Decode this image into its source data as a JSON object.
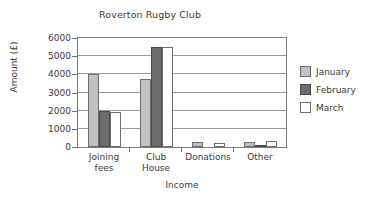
{
  "chart_data": {
    "type": "bar",
    "title": "Roverton Rugby Club",
    "xlabel": "Income",
    "ylabel": "Amount (£)",
    "categories": [
      "Joining fees",
      "Club House",
      "Donations",
      "Other"
    ],
    "category_lines": [
      [
        "Joining",
        "fees"
      ],
      [
        "Club",
        "House"
      ],
      [
        "Donations",
        ""
      ],
      [
        "Other",
        ""
      ]
    ],
    "series": [
      {
        "name": "January",
        "color": "#c2c2c2",
        "values": [
          4000,
          3750,
          300,
          250
        ]
      },
      {
        "name": "February",
        "color": "#6d6d6d",
        "values": [
          2000,
          5500,
          0,
          100
        ]
      },
      {
        "name": "March",
        "color": "#ffffff",
        "values": [
          1950,
          5500,
          200,
          350
        ]
      }
    ],
    "ylim": [
      0,
      6000
    ],
    "ytick_labels": [
      "6000",
      "5000",
      "4000",
      "3000",
      "2000",
      "1000",
      "0"
    ],
    "ytick_values": [
      6000,
      5000,
      4000,
      3000,
      2000,
      1000,
      0
    ],
    "grid": true,
    "legend_position": "right"
  }
}
